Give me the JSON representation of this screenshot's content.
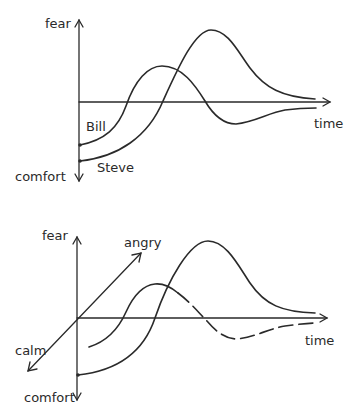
{
  "diagrams": [
    {
      "title": "",
      "y_axis": {
        "top_label": "fear",
        "bottom_label": "comfort"
      },
      "x_axis": {
        "label": "time"
      },
      "curves": [
        {
          "name": "Bill",
          "label": "Bill"
        },
        {
          "name": "Steve",
          "label": "Steve"
        }
      ]
    },
    {
      "title": "",
      "y_axis": {
        "top_label": "fear",
        "bottom_label": "comfort"
      },
      "x_axis": {
        "label": "time"
      },
      "z_axis": {
        "positive_label": "angry",
        "negative_label": "calm"
      },
      "curves": [
        {
          "name": "curve-1",
          "label": ""
        },
        {
          "name": "curve-2",
          "label": ""
        }
      ]
    }
  ],
  "colors": {
    "ink": "#2a2a2a",
    "background": "#ffffff"
  }
}
